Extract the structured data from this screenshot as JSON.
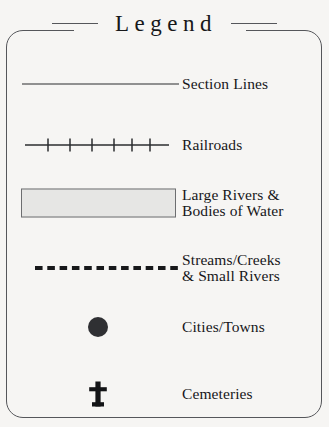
{
  "title": "Legend",
  "frame": {
    "border_color": "#55565a",
    "background_color": "#f6f5f3"
  },
  "entries": [
    {
      "symbol": "solid-line",
      "label_line1": "Section Lines",
      "label_line2": "",
      "color": "#2b2c2f"
    },
    {
      "symbol": "railroad-line",
      "label_line1": "Railroads",
      "label_line2": "",
      "color": "#2b2c2f",
      "tick_count": 6
    },
    {
      "symbol": "filled-rectangle",
      "label_line1": "Large Rivers &",
      "label_line2": "Bodies of Water",
      "fill_color": "#e6e6e4",
      "border_color": "#6d6e70"
    },
    {
      "symbol": "dashed-line",
      "label_line1": "Streams/Creeks",
      "label_line2": "& Small Rivers",
      "color": "#17181a"
    },
    {
      "symbol": "filled-circle",
      "label_line1": "Cities/Towns",
      "label_line2": "",
      "color": "#2f3033"
    },
    {
      "symbol": "cross",
      "label_line1": "Cemeteries",
      "label_line2": "",
      "color": "#131416"
    }
  ]
}
